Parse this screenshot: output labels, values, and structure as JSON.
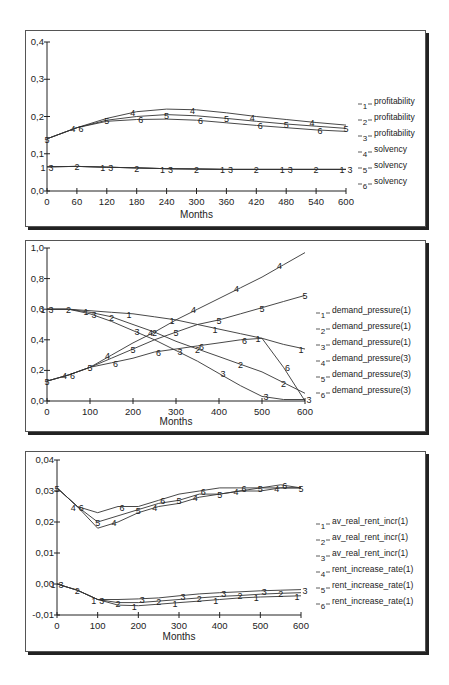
{
  "chart_data": [
    {
      "type": "line",
      "title": "",
      "xlabel": "Months",
      "ylabel": "",
      "xlim": [
        0,
        600
      ],
      "ylim": [
        0,
        0.4
      ],
      "xticks": [
        0,
        60,
        120,
        180,
        240,
        300,
        360,
        420,
        480,
        540,
        600
      ],
      "xtick_labels": [
        "0",
        "60",
        "120",
        "180",
        "240",
        "300",
        "360",
        "420",
        "480",
        "540",
        "600"
      ],
      "yticks": [
        0,
        0.1,
        0.2,
        0.3,
        0.4
      ],
      "ytick_labels": [
        "0,0",
        "0,1",
        "0,2",
        "0,3",
        "0,4"
      ],
      "grid": false,
      "legend_position": "right",
      "x": [
        0,
        60,
        120,
        180,
        240,
        300,
        360,
        420,
        480,
        540,
        600
      ],
      "series": [
        {
          "id": "1",
          "name": "profitability",
          "values": [
            0.065,
            0.066,
            0.064,
            0.062,
            0.06,
            0.059,
            0.058,
            0.058,
            0.058,
            0.058,
            0.058
          ]
        },
        {
          "id": "2",
          "name": "profitability",
          "values": [
            0.065,
            0.066,
            0.064,
            0.062,
            0.06,
            0.059,
            0.058,
            0.058,
            0.058,
            0.058,
            0.058
          ]
        },
        {
          "id": "3",
          "name": "profitability",
          "values": [
            0.065,
            0.066,
            0.064,
            0.062,
            0.06,
            0.059,
            0.058,
            0.058,
            0.058,
            0.058,
            0.058
          ]
        },
        {
          "id": "4",
          "name": "solvency",
          "values": [
            0.14,
            0.17,
            0.195,
            0.213,
            0.22,
            0.218,
            0.21,
            0.2,
            0.192,
            0.184,
            0.177
          ]
        },
        {
          "id": "5",
          "name": "solvency",
          "values": [
            0.14,
            0.17,
            0.19,
            0.2,
            0.205,
            0.202,
            0.195,
            0.187,
            0.18,
            0.174,
            0.168
          ]
        },
        {
          "id": "6",
          "name": "solvency",
          "values": [
            0.14,
            0.17,
            0.187,
            0.192,
            0.193,
            0.19,
            0.183,
            0.176,
            0.17,
            0.164,
            0.16
          ]
        }
      ]
    },
    {
      "type": "line",
      "title": "",
      "xlabel": "Months",
      "ylabel": "",
      "xlim": [
        0,
        600
      ],
      "ylim": [
        0,
        1.0
      ],
      "xticks": [
        0,
        100,
        200,
        300,
        400,
        500,
        600
      ],
      "xtick_labels": [
        "0",
        "100",
        "200",
        "300",
        "400",
        "500",
        "600"
      ],
      "yticks": [
        0,
        0.2,
        0.4,
        0.6,
        0.8,
        1.0
      ],
      "ytick_labels": [
        "0,0",
        "0,2",
        "0,4",
        "0,6",
        "0,8",
        "1,0"
      ],
      "grid": false,
      "legend_position": "right",
      "x": [
        0,
        50,
        100,
        150,
        200,
        250,
        300,
        350,
        400,
        450,
        500,
        550,
        600
      ],
      "series": [
        {
          "id": "1",
          "name": "demand_pressure(1)",
          "values": [
            0.6,
            0.6,
            0.59,
            0.58,
            0.57,
            0.55,
            0.53,
            0.5,
            0.47,
            0.44,
            0.41,
            0.37,
            0.34
          ]
        },
        {
          "id": "2",
          "name": "demand_pressure(1)",
          "values": [
            0.6,
            0.6,
            0.58,
            0.55,
            0.5,
            0.45,
            0.39,
            0.34,
            0.29,
            0.24,
            0.19,
            0.12,
            0.05
          ]
        },
        {
          "id": "3",
          "name": "demand_pressure(1)",
          "values": [
            0.6,
            0.6,
            0.57,
            0.52,
            0.46,
            0.4,
            0.33,
            0.26,
            0.18,
            0.1,
            0.03,
            0.01,
            0.01
          ]
        },
        {
          "id": "4",
          "name": "demand_pressure(3)",
          "values": [
            0.13,
            0.17,
            0.22,
            0.3,
            0.38,
            0.45,
            0.53,
            0.6,
            0.67,
            0.74,
            0.81,
            0.89,
            0.97
          ]
        },
        {
          "id": "5",
          "name": "demand_pressure(3)",
          "values": [
            0.13,
            0.17,
            0.22,
            0.28,
            0.34,
            0.4,
            0.45,
            0.5,
            0.53,
            0.57,
            0.61,
            0.65,
            0.69
          ]
        },
        {
          "id": "6",
          "name": "demand_pressure(3)",
          "values": [
            0.13,
            0.17,
            0.22,
            0.25,
            0.28,
            0.32,
            0.34,
            0.36,
            0.38,
            0.4,
            0.41,
            0.22,
            0.0
          ]
        }
      ]
    },
    {
      "type": "line",
      "title": "",
      "xlabel": "Months",
      "ylabel": "",
      "xlim": [
        0,
        600
      ],
      "ylim": [
        -0.01,
        0.04
      ],
      "xticks": [
        0,
        100,
        200,
        300,
        400,
        500,
        600
      ],
      "xtick_labels": [
        "0",
        "100",
        "200",
        "300",
        "400",
        "500",
        "600"
      ],
      "yticks": [
        -0.01,
        0.0,
        0.01,
        0.02,
        0.03,
        0.04
      ],
      "ytick_labels": [
        "-0,01",
        "0,00",
        "0,01",
        "0,02",
        "0,03",
        "0,04"
      ],
      "grid": false,
      "legend_position": "right",
      "x": [
        0,
        50,
        100,
        150,
        200,
        250,
        300,
        350,
        400,
        450,
        500,
        550,
        600
      ],
      "series": [
        {
          "id": "1",
          "name": "av_real_rent_incr(1)",
          "values": [
            0.0,
            -0.002,
            -0.005,
            -0.0068,
            -0.007,
            -0.0065,
            -0.006,
            -0.0055,
            -0.005,
            -0.0045,
            -0.0042,
            -0.004,
            -0.0038
          ]
        },
        {
          "id": "2",
          "name": "av_real_rent_incr(1)",
          "values": [
            0.0,
            -0.002,
            -0.005,
            -0.006,
            -0.006,
            -0.0055,
            -0.005,
            -0.0045,
            -0.004,
            -0.0037,
            -0.0033,
            -0.003,
            -0.0028
          ]
        },
        {
          "id": "3",
          "name": "av_real_rent_incr(1)",
          "values": [
            0.0,
            -0.002,
            -0.005,
            -0.005,
            -0.0048,
            -0.0045,
            -0.0038,
            -0.0032,
            -0.0028,
            -0.0025,
            -0.0022,
            -0.002,
            -0.0018
          ]
        },
        {
          "id": "4",
          "name": "rent_increase_rate(1)",
          "values": [
            0.031,
            0.025,
            0.018,
            0.02,
            0.023,
            0.025,
            0.026,
            0.028,
            0.029,
            0.03,
            0.03,
            0.031,
            0.031
          ]
        },
        {
          "id": "5",
          "name": "rent_increase_rate(1)",
          "values": [
            0.031,
            0.025,
            0.02,
            0.022,
            0.024,
            0.026,
            0.027,
            0.029,
            0.029,
            0.03,
            0.031,
            0.031,
            0.031
          ]
        },
        {
          "id": "6",
          "name": "rent_increase_rate(1)",
          "values": [
            0.031,
            0.025,
            0.023,
            0.025,
            0.025,
            0.027,
            0.029,
            0.03,
            0.031,
            0.031,
            0.031,
            0.032,
            0.031
          ]
        }
      ]
    }
  ],
  "charts": [
    {
      "xlabel": "Months",
      "legend": [
        "profitability",
        "profitability",
        "profitability",
        "solvency",
        "solvency",
        "solvency"
      ]
    },
    {
      "xlabel": "Months",
      "legend": [
        "demand_pressure(1)",
        "demand_pressure(1)",
        "demand_pressure(1)",
        "demand_pressure(3)",
        "demand_pressure(3)",
        "demand_pressure(3)"
      ]
    },
    {
      "xlabel": "Months",
      "legend": [
        "av_real_rent_incr(1)",
        "av_real_rent_incr(1)",
        "av_real_rent_incr(1)",
        "rent_increase_rate(1)",
        "rent_increase_rate(1)",
        "rent_increase_rate(1)"
      ]
    }
  ]
}
